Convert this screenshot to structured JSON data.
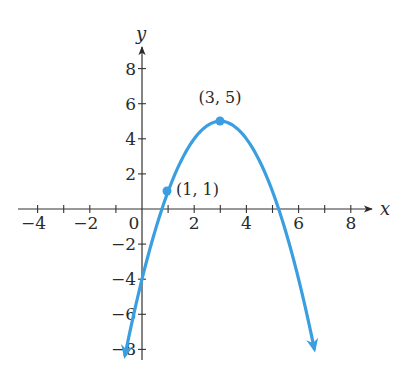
{
  "chart_data": {
    "type": "line",
    "title": "",
    "function": "y = -(x - 3)^2 + 5",
    "xlabel": "x",
    "ylabel": "y",
    "xlim": [
      -4.5,
      8.6
    ],
    "ylim": [
      -8.5,
      9.0
    ],
    "x_ticks": [
      -4,
      -3,
      -2,
      -1,
      1,
      2,
      3,
      4,
      5,
      6,
      7,
      8
    ],
    "x_tick_labels": [
      "-4",
      "-2",
      "0",
      "2",
      "4",
      "6",
      "8"
    ],
    "x_tick_label_values": [
      -4,
      -2,
      0,
      2,
      4,
      6,
      8
    ],
    "y_ticks": [
      8,
      6,
      4,
      2,
      -2,
      -4,
      -6,
      -8
    ],
    "y_tick_labels": [
      "8",
      "6",
      "4",
      "2",
      "-2",
      "-4",
      "-6",
      "-8"
    ],
    "grid": false,
    "curve_domain": [
      -0.65,
      6.6
    ],
    "points": [
      {
        "x": 1,
        "y": 1,
        "label": "(1, 1)"
      },
      {
        "x": 3,
        "y": 5,
        "label": "(3, 5)"
      }
    ],
    "series": [
      {
        "name": "parabola",
        "color": "#3a9ee0",
        "x": [
          -0.65,
          0,
          1,
          2,
          3,
          4,
          5,
          6,
          6.6
        ],
        "values": [
          -8.32,
          -4,
          1,
          4,
          5,
          4,
          1,
          -4,
          -7.96
        ]
      }
    ]
  },
  "colors": {
    "curve": "#3a9ee0",
    "axis": "#333333"
  },
  "labels": {
    "x_axis": "x",
    "y_axis": "y",
    "vertex": "(3, 5)",
    "point": "(1, 1)"
  }
}
